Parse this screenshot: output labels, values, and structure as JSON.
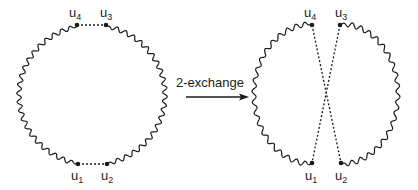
{
  "diagram": {
    "type": "tour-2-exchange",
    "arrow_label": "2-exchange",
    "colors": {
      "stroke": "#1a1a1a",
      "background": "#ffffff"
    },
    "before": {
      "nodes": [
        {
          "id": "u1",
          "base": "u",
          "sub": "1"
        },
        {
          "id": "u2",
          "base": "u",
          "sub": "2"
        },
        {
          "id": "u3",
          "base": "u",
          "sub": "3"
        },
        {
          "id": "u4",
          "base": "u",
          "sub": "4"
        }
      ],
      "dashed_edges": [
        [
          "u4",
          "u3"
        ],
        [
          "u1",
          "u2"
        ]
      ]
    },
    "after": {
      "nodes": [
        {
          "id": "u1",
          "base": "u",
          "sub": "1"
        },
        {
          "id": "u2",
          "base": "u",
          "sub": "2"
        },
        {
          "id": "u3",
          "base": "u",
          "sub": "3"
        },
        {
          "id": "u4",
          "base": "u",
          "sub": "4"
        }
      ],
      "dashed_edges": [
        [
          "u4",
          "u2"
        ],
        [
          "u3",
          "u1"
        ]
      ]
    }
  }
}
